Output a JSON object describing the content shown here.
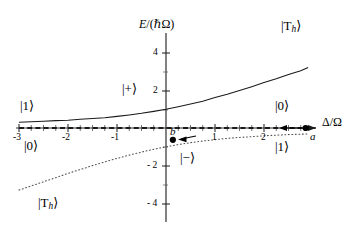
{
  "figure": {
    "background": "#ffffff",
    "ink": "#1a1a1a"
  },
  "chart_data": {
    "type": "line",
    "title": "",
    "xlabel": "Δ/Ω",
    "ylabel": "E/(ℏΩ)",
    "xlim": [
      -3.0,
      3.1
    ],
    "ylim": [
      -5.2,
      5.4
    ],
    "xticks": [
      -3,
      -2,
      -1,
      1,
      2
    ],
    "xtick_labels": [
      "-3",
      "-2",
      "-1",
      "1",
      "2"
    ],
    "yticks": [
      4,
      2,
      -2,
      -4
    ],
    "ytick_labels": [
      "4",
      "2",
      "- 2",
      "- 4"
    ],
    "grid": false,
    "legend_position": "inline-annotations",
    "minor_ticks_on_x_axis": true,
    "series": [
      {
        "name": "|+⟩",
        "style": "solid",
        "color": "#1a1a1a",
        "formula": "E+ = (x + sqrt(x*x + 4)) / 2",
        "x": [
          -3.0,
          -2.75,
          -2.5,
          -2.25,
          -2.0,
          -1.75,
          -1.5,
          -1.25,
          -1.0,
          -0.75,
          -0.5,
          -0.25,
          0.0,
          0.25,
          0.5,
          0.75,
          1.0,
          1.25,
          1.5,
          1.75,
          2.0,
          2.25,
          2.5,
          2.75,
          2.9
        ],
        "y": [
          0.303,
          0.329,
          0.358,
          0.393,
          0.414,
          0.461,
          0.5,
          0.55,
          0.618,
          0.693,
          0.781,
          0.884,
          1.0,
          1.133,
          1.281,
          1.425,
          1.618,
          1.8,
          2.0,
          2.2,
          2.414,
          2.62,
          2.851,
          3.05,
          3.22
        ]
      },
      {
        "name": "|−⟩",
        "style": "dotted",
        "color": "#4d4d4d",
        "formula": "E- = (x - sqrt(x*x + 4)) / 2",
        "x": [
          -3.0,
          -2.75,
          -2.5,
          -2.25,
          -2.0,
          -1.75,
          -1.5,
          -1.25,
          -1.0,
          -0.75,
          -0.5,
          -0.25,
          0.0,
          0.25,
          0.5,
          0.75,
          1.0,
          1.25,
          1.5,
          1.75,
          2.0,
          2.25,
          2.5,
          2.75,
          2.9
        ],
        "y": [
          -3.303,
          -3.079,
          -2.858,
          -2.643,
          -2.414,
          -2.211,
          -2.0,
          -1.8,
          -1.618,
          -1.443,
          -1.281,
          -1.133,
          -1.0,
          -0.884,
          -0.781,
          -0.693,
          -0.618,
          -0.55,
          -0.5,
          -0.461,
          -0.414,
          -0.38,
          -0.351,
          -0.329,
          -0.316
        ]
      },
      {
        "name": "E = 0 asymptote",
        "style": "dashed",
        "color": "#1a1a1a",
        "x": [
          -3.0,
          3.05
        ],
        "y": [
          0,
          0
        ]
      }
    ],
    "points": [
      {
        "label": "a",
        "x": 2.85,
        "y": 0.0,
        "marker": "filled-circle"
      },
      {
        "label": "b",
        "x": 0.14,
        "y": -0.63,
        "marker": "filled-circle"
      }
    ],
    "arrows": [
      {
        "name": "sweep-arrow-right",
        "from_x": 2.62,
        "to_x": 2.2,
        "y": 0.0,
        "direction": "left"
      },
      {
        "name": "sweep-arrow-left",
        "from_x": 0.62,
        "to_x": 0.3,
        "y": -0.52,
        "direction": "left"
      }
    ],
    "annotations": [
      {
        "name": "upper-branch-high-field",
        "text": "|Tₕ⟩",
        "x": 2.45,
        "y": 4.15
      },
      {
        "name": "lower-branch-low-field",
        "text": "|Tₕ⟩",
        "x": -2.6,
        "y": -3.95
      },
      {
        "name": "plus-state",
        "text": "|+⟩",
        "x": -0.85,
        "y": 2.1
      },
      {
        "name": "minus-state",
        "text": "|−⟩",
        "x": 0.38,
        "y": -1.55
      },
      {
        "name": "left-upper-asymptote-state",
        "text": "|1⟩",
        "x": -2.65,
        "y": 0.82
      },
      {
        "name": "left-lower-asymptote-state",
        "text": "|0⟩",
        "x": -2.55,
        "y": -0.75
      },
      {
        "name": "right-upper-asymptote-state",
        "text": "|0⟩",
        "x": 2.35,
        "y": 0.82
      },
      {
        "name": "right-lower-asymptote-state",
        "text": "|1⟩",
        "x": 2.35,
        "y": -0.85
      }
    ]
  },
  "labels": {
    "y_axis_title": "E/(ℏΩ)",
    "y_axis_title_parts": {
      "numerator": "E",
      "slash": "/",
      "open": "(",
      "hbar": "ℏ",
      "omega": "Ω",
      "close": ")"
    },
    "x_axis_title": "Δ/Ω",
    "x_axis_title_parts": {
      "delta": "Δ",
      "slash": "/",
      "omega": "Ω"
    },
    "tick_x_m3": "-3",
    "tick_x_m2": "-2",
    "tick_x_m1": "-1",
    "tick_x_p1": "1",
    "tick_x_p2": "2",
    "tick_y_p4": "4",
    "tick_y_p2": "2",
    "tick_y_m2": "- 2",
    "tick_y_m4": "- 4",
    "point_a": "a",
    "point_b": "b",
    "ket_T_main": "|T",
    "ket_T_sub": "h",
    "ket_T_close": "⟩",
    "ket_plus": "|+⟩",
    "ket_minus": "|−⟩",
    "ket_zero": "|0⟩",
    "ket_one": "|1⟩"
  }
}
